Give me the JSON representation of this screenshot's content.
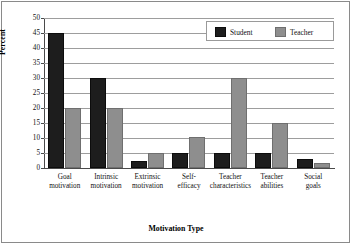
{
  "chart_data": {
    "type": "bar",
    "title": "",
    "xlabel": "Motivation Type",
    "ylabel": "Percent",
    "ylim": [
      0,
      50
    ],
    "ytick_step": 5,
    "yticks": [
      "50",
      "45",
      "40",
      "35",
      "30",
      "25",
      "20",
      "15",
      "10",
      "5",
      "0"
    ],
    "grid": true,
    "legend_position": "top-right",
    "categories": [
      "Goal motivation",
      "Intrinsic motivation",
      "Extrinsic motivation",
      "Self-efficacy",
      "Teacher characteristics",
      "Teacher abilities",
      "Social goals"
    ],
    "category_lines": [
      [
        "Goal",
        "motivation"
      ],
      [
        "Intrinsic",
        "motivation"
      ],
      [
        "Extrinsic",
        "motivation"
      ],
      [
        "Self-",
        "efficacy"
      ],
      [
        "Teacher",
        "characteristics"
      ],
      [
        "Teacher",
        "abilities"
      ],
      [
        "Social",
        "goals"
      ]
    ],
    "series": [
      {
        "name": "Student",
        "color": "#1d1d1d",
        "values": [
          45,
          30,
          2.5,
          5,
          5,
          5,
          3
        ]
      },
      {
        "name": "Teacher",
        "color": "#8e8e8e",
        "values": [
          20,
          20,
          5,
          10.5,
          30,
          15,
          1.7
        ]
      }
    ]
  },
  "legend": {
    "items": [
      {
        "label": "Student",
        "swatch": "student"
      },
      {
        "label": "Teacher",
        "swatch": "teacher"
      }
    ]
  },
  "colors": {
    "student": "#1d1d1d",
    "teacher": "#8e8e8e",
    "grid": "#9d9d9d",
    "axis": "#4a4a4a",
    "border": "#8a8a8a"
  }
}
